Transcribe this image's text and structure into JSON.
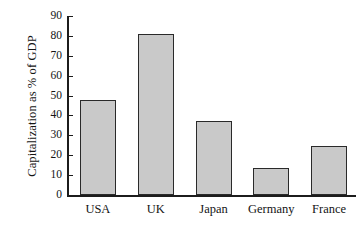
{
  "chart_data": {
    "type": "bar",
    "title": "",
    "xlabel": "",
    "ylabel": "Capitalization as % of GDP",
    "categories": [
      "USA",
      "UK",
      "Japan",
      "Germany",
      "France"
    ],
    "values": [
      48,
      81,
      37,
      13.5,
      24.5
    ],
    "ylim": [
      0,
      90
    ],
    "yticks": [
      0,
      10,
      20,
      30,
      40,
      50,
      60,
      70,
      80,
      90
    ],
    "ytick_labels": [
      "0",
      "10",
      "20",
      "30",
      "40",
      "50",
      "60",
      "70",
      "80",
      "90"
    ],
    "grid": false,
    "legend": null,
    "bar_fill_color": "#c9c9c9",
    "bar_edge_color": "#2a2a2a",
    "axis_color": "#1c1c1c",
    "background_color": "#ffffff"
  },
  "axes": {
    "y_title": "Capitalization as % of GDP"
  }
}
